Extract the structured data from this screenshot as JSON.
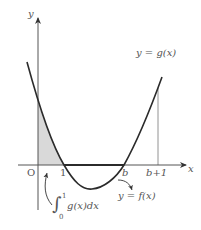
{
  "diagram": {
    "type": "function-graph",
    "axes": {
      "x_label": "x",
      "y_label": "y",
      "origin_label": "O"
    },
    "x_ticks": [
      "1",
      "b",
      "b+1"
    ],
    "curves": [
      {
        "label": "y = g(x)",
        "description": "parabola through (1,0) and (b,0), shown up to x = b+1"
      },
      {
        "label": "y = f(x)",
        "description": "segment of x-axis from 1 to b (bold)"
      }
    ],
    "shaded_region": {
      "label": "∫₀¹ g(x)dx",
      "from": "0",
      "to": "1",
      "fill": "#d9d9d9"
    },
    "annotations": {
      "g_label": "y = g(x)",
      "f_label": "y = f(x)",
      "integral_label": {
        "integral_sign": "∫",
        "upper": "1",
        "lower": "0",
        "body": "g(x)dx"
      }
    },
    "colors": {
      "curve": "#2b2b2b",
      "axis": "#555555",
      "shade": "#d9d9d9",
      "text": "#555555"
    }
  }
}
